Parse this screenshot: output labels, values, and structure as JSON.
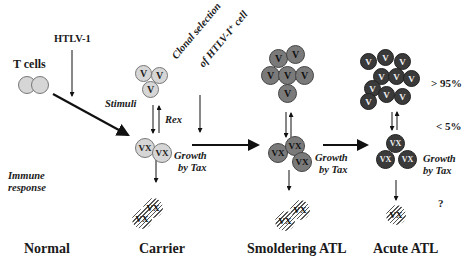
{
  "diagram": {
    "stages": [
      "Normal",
      "Carrier",
      "Smoldering ATL",
      "Acute ATL"
    ],
    "labels": {
      "t_cells": "T cells",
      "htlv1": "HTLV-1",
      "stimuli": "Stimuli",
      "rex": "Rex",
      "immune_response_1": "Immune",
      "immune_response_2": "response",
      "clonal_selection_1": "Clonal selection",
      "clonal_selection_2": "of HTLV-I⁺ cell",
      "growth_by_tax_1": "Growth",
      "growth_by_tax_2": "by Tax",
      "pct_high": "> 95%",
      "pct_low": "< 5%",
      "question": "?"
    },
    "cell_marks": {
      "v": "V",
      "vx": "VX"
    },
    "colors": {
      "normal_cell": "#d6d6d6",
      "smoldering_cell": "#7a7a7a",
      "acute_cell": "#3a3a3a"
    }
  }
}
